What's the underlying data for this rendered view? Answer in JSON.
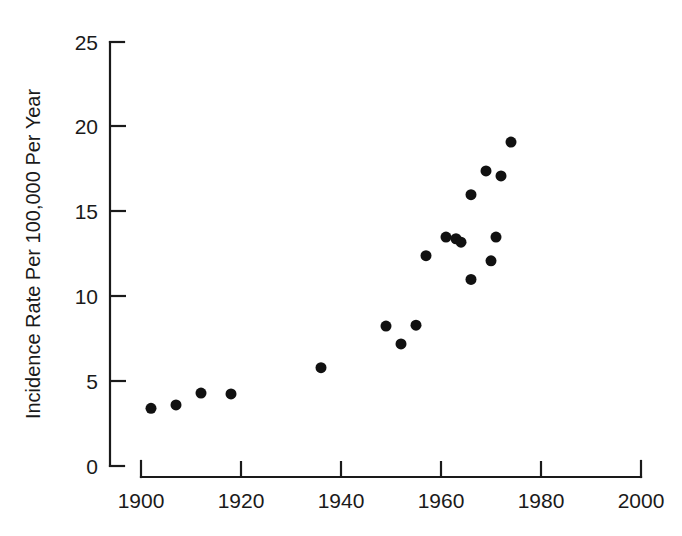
{
  "chart_data": {
    "type": "scatter",
    "title": "",
    "xlabel": "",
    "ylabel": "Incidence Rate Per 100,000 Per Year",
    "xlim": [
      1900,
      2000
    ],
    "ylim": [
      0,
      25
    ],
    "xticks": [
      1900,
      1920,
      1940,
      1960,
      1980,
      2000
    ],
    "xtick_labels": [
      "1900",
      "1920",
      "1940",
      "1960",
      "1980",
      "2000"
    ],
    "yticks": [
      0,
      5,
      10,
      15,
      20,
      25
    ],
    "ytick_labels": [
      "0",
      "5",
      "10",
      "15",
      "20",
      "25"
    ],
    "grid": false,
    "legend": null,
    "marker": "filled-circle",
    "marker_color": "#111111",
    "marker_size": 11,
    "x": [
      1902,
      1907,
      1912,
      1918,
      1937,
      1949,
      1952,
      1955,
      1958,
      1961,
      1964,
      1963,
      1966,
      1966,
      1969,
      1970,
      1971,
      1969,
      1972,
      1974,
      1957
    ],
    "y": [
      3.4,
      3.6,
      4.3,
      4.25,
      5.8,
      8.3,
      7.2,
      8.4,
      12.4,
      13.5,
      13.3,
      13.4,
      16.0,
      11.0,
      17.4,
      12.1,
      13.5,
      17.3,
      17.1,
      19.1,
      12.3
    ],
    "points": [
      {
        "x": 1902,
        "y": 3.4
      },
      {
        "x": 1907,
        "y": 3.6
      },
      {
        "x": 1912,
        "y": 4.3
      },
      {
        "x": 1918,
        "y": 4.25
      },
      {
        "x": 1936,
        "y": 5.8
      },
      {
        "x": 1949,
        "y": 8.25
      },
      {
        "x": 1952,
        "y": 7.2
      },
      {
        "x": 1955,
        "y": 8.3
      },
      {
        "x": 1957,
        "y": 12.4
      },
      {
        "x": 1961,
        "y": 13.5
      },
      {
        "x": 1963,
        "y": 13.4
      },
      {
        "x": 1964,
        "y": 13.2
      },
      {
        "x": 1966,
        "y": 16.0
      },
      {
        "x": 1966,
        "y": 11.0
      },
      {
        "x": 1969,
        "y": 17.4
      },
      {
        "x": 1970,
        "y": 12.1
      },
      {
        "x": 1971,
        "y": 13.5
      },
      {
        "x": 1972,
        "y": 17.1
      },
      {
        "x": 1974,
        "y": 19.1
      }
    ]
  },
  "axes": {
    "y_axis_title": "Incidence Rate Per 100,000 Per Year",
    "x_axis_title": "",
    "y_tick_labels": [
      "25",
      "20",
      "15",
      "10",
      "5",
      "0"
    ],
    "x_tick_labels": [
      "1900",
      "1920",
      "1940",
      "1960",
      "1980",
      "2000"
    ]
  },
  "colors": {
    "marker": "#111111",
    "axis": "#1a1a1a",
    "background": "#ffffff"
  }
}
